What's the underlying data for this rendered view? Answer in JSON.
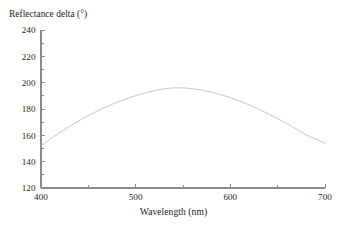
{
  "chart_data": {
    "type": "line",
    "title": "",
    "subtitle": "",
    "xlabel": "Wavelength (nm)",
    "ylabel": "Reflectance delta (°)",
    "xlim": [
      400,
      700
    ],
    "ylim": [
      120,
      240
    ],
    "grid": false,
    "legend": null,
    "legend_position": "none",
    "x_major_ticks": [
      400,
      500,
      600,
      700
    ],
    "x_minor_ticks": [
      450,
      550,
      650
    ],
    "x_tick_labels": [
      "400",
      "500",
      "600",
      "700"
    ],
    "y_major_ticks": [
      120,
      140,
      160,
      180,
      200,
      220,
      240
    ],
    "y_minor_ticks": [
      130,
      150,
      170,
      190,
      210,
      230
    ],
    "y_tick_labels": [
      "120",
      "140",
      "160",
      "180",
      "200",
      "220",
      "240"
    ],
    "series": [
      {
        "name": "Reflectance delta",
        "color": "#c9c9c9",
        "x": [
          400,
          410,
          420,
          430,
          440,
          450,
          460,
          470,
          480,
          490,
          500,
          510,
          520,
          530,
          540,
          550,
          560,
          570,
          580,
          590,
          600,
          610,
          620,
          630,
          640,
          650,
          660,
          670,
          680,
          690,
          700
        ],
        "values": [
          152.0,
          157.2,
          162.1,
          166.7,
          171.0,
          175.0,
          178.7,
          182.0,
          185.0,
          187.7,
          190.1,
          192.2,
          194.0,
          195.3,
          196.0,
          196.0,
          195.4,
          194.3,
          192.8,
          190.9,
          188.6,
          186.0,
          183.1,
          179.9,
          176.4,
          172.7,
          168.8,
          164.7,
          160.4,
          157.2,
          154.0
        ]
      }
    ],
    "annotations": [],
    "peak": {
      "x": 535,
      "y": 196
    },
    "axis_color": "#8a8a8a",
    "text_color": "#1c1c1c",
    "background": "#ffffff"
  },
  "axis_titles": {
    "y": "Reflectance delta (°)",
    "x": "Wavelength (nm)"
  }
}
